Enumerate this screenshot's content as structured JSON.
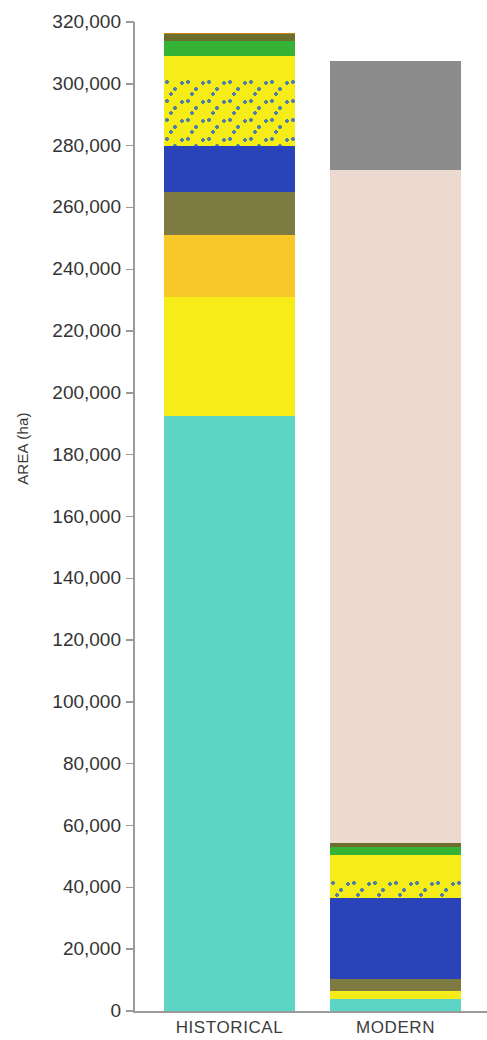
{
  "chart_data": {
    "type": "bar",
    "subtype": "stacked",
    "title": "",
    "xlabel": "",
    "ylabel": "AREA (ha)",
    "ylim": [
      0,
      320000
    ],
    "ytick_labels": [
      "320,000",
      "300,000",
      "280,000",
      "260,000",
      "240,000",
      "220,000",
      "200,000",
      "180,000",
      "160,000",
      "140,000",
      "120,000",
      "100,000",
      "80,000",
      "60,000",
      "40,000",
      "20,000",
      "0"
    ],
    "ytick_values": [
      320000,
      300000,
      280000,
      260000,
      240000,
      220000,
      200000,
      180000,
      160000,
      140000,
      120000,
      100000,
      80000,
      60000,
      40000,
      20000,
      0
    ],
    "grid": false,
    "legend": "none",
    "categories": [
      "HISTORICAL",
      "MODERN"
    ],
    "totals": [
      316000,
      307500
    ],
    "series": [
      {
        "name": "teal-base",
        "color": "#5dd5c4",
        "pattern": "solid",
        "values": [
          192500,
          4000
        ]
      },
      {
        "name": "bright-yellow",
        "color": "#f5ec18",
        "pattern": "solid",
        "values": [
          38500,
          2500
        ]
      },
      {
        "name": "olive-khaki",
        "color": "#7d7a42",
        "pattern": "solid",
        "values": [
          0,
          3500
        ]
      },
      {
        "name": "blue",
        "color": "#2b43b8",
        "pattern": "solid",
        "values": [
          0,
          26000
        ]
      },
      {
        "name": "gold-amber",
        "color": "#f7c827",
        "pattern": "solid",
        "values": [
          20000,
          0
        ]
      },
      {
        "name": "olive-khaki-2",
        "color": "#7d7a42",
        "pattern": "solid",
        "values": [
          20000,
          0
        ]
      },
      {
        "name": "blue-2",
        "color": "#2b43b8",
        "pattern": "solid",
        "values": [
          14000,
          0
        ]
      },
      {
        "name": "stippled-yellow",
        "color": "#f5ec18",
        "pattern": "dotted",
        "values": [
          21500,
          6000
        ]
      },
      {
        "name": "yellow-upper",
        "color": "#f5ec18",
        "pattern": "solid",
        "values": [
          7500,
          8000
        ]
      },
      {
        "name": "green",
        "color": "#35b335",
        "pattern": "solid",
        "values": [
          5000,
          2500
        ]
      },
      {
        "name": "dark-olive",
        "color": "#6d6d2e",
        "pattern": "solid",
        "values": [
          2000,
          1500
        ]
      },
      {
        "name": "orange-tan",
        "color": "#c8860f",
        "pattern": "solid",
        "values": [
          2000,
          0
        ]
      },
      {
        "name": "beige",
        "color": "#ecd9cf",
        "pattern": "solid",
        "values": [
          0,
          217000
        ]
      },
      {
        "name": "grey",
        "color": "#8c8c8c",
        "pattern": "solid",
        "values": [
          0,
          35500
        ]
      }
    ],
    "historical_stack_bottom_to_top": [
      {
        "label": "teal-base",
        "color": "#5dd5c4",
        "start": 0,
        "end": 192500
      },
      {
        "label": "bright-yellow",
        "color": "#f5ec18",
        "start": 192500,
        "end": 231000
      },
      {
        "label": "gold-amber",
        "color": "#f7c827",
        "start": 231000,
        "end": 251000
      },
      {
        "label": "olive-khaki",
        "color": "#7d7a42",
        "start": 251000,
        "end": 265000
      },
      {
        "label": "blue",
        "color": "#2b43b8",
        "start": 265000,
        "end": 280000
      },
      {
        "label": "stippled-yellow",
        "color": "#f5ec18",
        "start": 280000,
        "end": 301500
      },
      {
        "label": "yellow-upper",
        "color": "#f5ec18",
        "start": 301500,
        "end": 309000
      },
      {
        "label": "green",
        "color": "#35b335",
        "start": 309000,
        "end": 314000
      },
      {
        "label": "dark-olive",
        "color": "#6d6d2e",
        "start": 314000,
        "end": 316000
      },
      {
        "label": "orange-tan",
        "color": "#c8860f",
        "start": 316000,
        "end": 316500
      }
    ],
    "modern_stack_bottom_to_top": [
      {
        "label": "teal-base",
        "color": "#5dd5c4",
        "start": 0,
        "end": 4000
      },
      {
        "label": "bright-yellow",
        "color": "#f5ec18",
        "start": 4000,
        "end": 6500
      },
      {
        "label": "olive-khaki",
        "color": "#7d7a42",
        "start": 6500,
        "end": 10500
      },
      {
        "label": "blue",
        "color": "#2b43b8",
        "start": 10500,
        "end": 36500
      },
      {
        "label": "stippled-yellow",
        "color": "#f5ec18",
        "start": 36500,
        "end": 42500
      },
      {
        "label": "yellow-upper",
        "color": "#f5ec18",
        "start": 42500,
        "end": 50500
      },
      {
        "label": "green",
        "color": "#35b335",
        "start": 50500,
        "end": 53000
      },
      {
        "label": "dark-olive",
        "color": "#6d6d2e",
        "start": 53000,
        "end": 54500
      },
      {
        "label": "beige",
        "color": "#ecd9cf",
        "start": 54500,
        "end": 272000
      },
      {
        "label": "grey",
        "color": "#8c8c8c",
        "start": 272000,
        "end": 307500
      }
    ]
  },
  "axis": {
    "y_title": "AREA (ha)"
  },
  "categories": {
    "historical": "HISTORICAL",
    "modern": "MODERN"
  }
}
